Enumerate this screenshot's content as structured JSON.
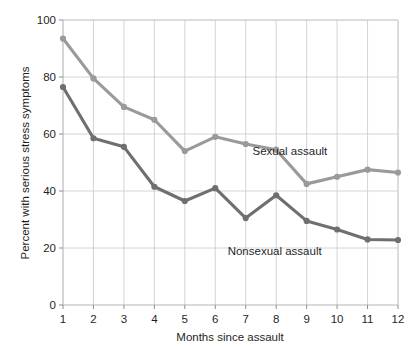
{
  "chart_data": {
    "type": "line",
    "title": "",
    "xlabel": "Months since assault",
    "ylabel": "Percent with serious stress symptoms",
    "x": [
      1,
      2,
      3,
      4,
      5,
      6,
      7,
      8,
      9,
      10,
      11,
      12
    ],
    "xtick_labels": [
      "1",
      "2",
      "3",
      "4",
      "5",
      "6",
      "7",
      "8",
      "9",
      "10",
      "11",
      "12"
    ],
    "ytick_labels": [
      "0",
      "20",
      "40",
      "60",
      "80",
      "100"
    ],
    "yticks": [
      0,
      20,
      40,
      60,
      80,
      100
    ],
    "xlim": [
      1,
      12
    ],
    "ylim": [
      0,
      100
    ],
    "grid": "both",
    "legend_position": "inline-annotation",
    "series": [
      {
        "name": "Sexual assault",
        "color": "#9a9a9a",
        "values": [
          93.5,
          79.5,
          69.5,
          65,
          54,
          59,
          56.5,
          54.5,
          42.5,
          45,
          47.5,
          46.5
        ],
        "annotation": "Sexual assault"
      },
      {
        "name": "Nonsexual assault",
        "color": "#6f6f6f",
        "values": [
          76.5,
          58.5,
          55.5,
          41.5,
          36.5,
          41,
          30.5,
          38.5,
          29.5,
          26.5,
          23,
          22.8
        ],
        "annotation": "Nonsexual assault"
      }
    ],
    "annotations": [
      {
        "text": "Sexual assault",
        "x": 8.45,
        "y": 52.5
      },
      {
        "text": "Nonsexual assault",
        "x": 7.95,
        "y": 17.5
      }
    ],
    "colors": {
      "sexual_assault": "#9a9a9a",
      "nonsexual_assault": "#6f6f6f",
      "grid": "#c9c9c9",
      "axis": "#b5b5b5",
      "text": "#1f1f1f",
      "background": "#ffffff"
    }
  }
}
